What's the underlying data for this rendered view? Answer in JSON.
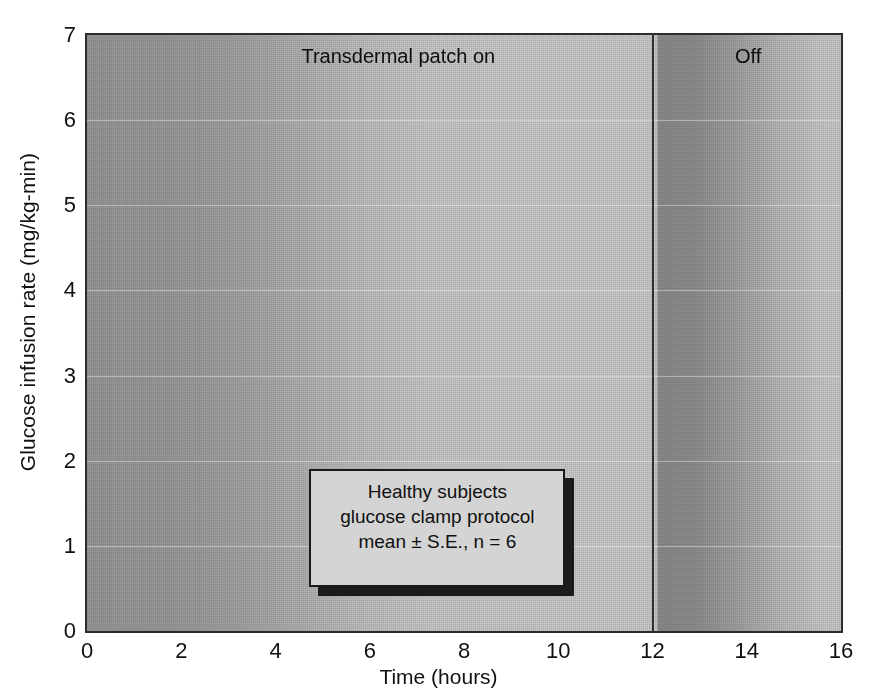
{
  "chart_data": {
    "type": "line",
    "title": "",
    "xlabel": "Time (hours)",
    "ylabel": "Glucose infusion rate (mg/kg-min)",
    "xlim": [
      0,
      16
    ],
    "ylim": [
      0,
      7
    ],
    "xticks": [
      0,
      2,
      4,
      6,
      8,
      10,
      12,
      14,
      16
    ],
    "yticks": [
      0,
      1,
      2,
      3,
      4,
      5,
      6,
      7
    ],
    "grid": true,
    "legend_position": "inside-bottom-center",
    "error_bars": "mean ± S.E.",
    "n": 6,
    "annotations": [
      {
        "text": "Transdermal patch on",
        "x_range": [
          0,
          12
        ]
      },
      {
        "text": "Off",
        "x_range": [
          12,
          16
        ]
      }
    ],
    "series": [
      {
        "name": "Glucose infusion rate",
        "x": [
          0,
          0.25,
          0.5,
          0.75,
          1,
          1.25,
          1.5,
          1.75,
          2,
          2.25,
          2.5,
          2.75,
          3,
          3.25,
          3.5,
          3.75,
          4,
          4.25,
          4.5,
          4.75,
          5,
          5.25,
          5.5,
          5.75,
          6,
          6.25,
          6.5,
          6.75,
          7,
          7.25,
          7.5,
          7.75,
          8,
          8.25,
          8.5,
          8.75,
          9,
          9.25,
          9.5,
          9.75,
          10,
          10.25,
          10.5,
          10.75,
          11,
          11.25,
          11.5,
          11.75,
          12,
          12.25,
          12.5,
          12.75,
          13,
          13.25,
          13.5,
          13.75,
          14,
          14.25,
          14.5,
          14.75,
          15,
          15.25,
          15.5,
          15.75,
          16
        ],
        "y": [
          0.05,
          0.3,
          0.5,
          0.62,
          0.72,
          0.85,
          1.05,
          1.35,
          1.6,
          1.9,
          2.1,
          2.45,
          2.8,
          2.9,
          2.85,
          3.25,
          3.7,
          4.1,
          4.45,
          4.6,
          4.55,
          4.62,
          4.7,
          4.95,
          5.05,
          4.78,
          4.6,
          4.55,
          4.62,
          4.7,
          5.0,
          4.9,
          4.7,
          4.58,
          4.62,
          4.62,
          4.55,
          4.6,
          4.7,
          4.6,
          4.5,
          4.78,
          4.98,
          4.85,
          4.55,
          4.35,
          4.28,
          4.3,
          4.3,
          4.32,
          4.32,
          4.3,
          3.8,
          3.55,
          3.3,
          2.95,
          2.7,
          2.45,
          2.22,
          1.95,
          1.72,
          1.55,
          1.42,
          1.38,
          1.6
        ],
        "yerr": [
          0.04,
          0.18,
          0.22,
          0.25,
          0.25,
          0.28,
          0.32,
          0.38,
          0.45,
          0.5,
          0.58,
          0.62,
          0.68,
          0.72,
          0.75,
          0.8,
          0.88,
          0.92,
          0.95,
          1.05,
          1.1,
          1.15,
          1.22,
          1.3,
          1.22,
          1.08,
          1.15,
          1.18,
          1.12,
          1.05,
          1.0,
          1.02,
          1.05,
          1.02,
          0.98,
          0.95,
          0.92,
          0.9,
          0.88,
          0.85,
          0.88,
          0.82,
          0.8,
          0.78,
          0.72,
          0.65,
          0.62,
          0.58,
          0.5,
          0.45,
          0.4,
          0.42,
          0.48,
          0.52,
          0.5,
          0.48,
          0.45,
          0.42,
          0.38,
          0.35,
          0.3,
          0.25,
          0.2,
          0.18,
          0.12
        ],
        "final_drop_to_zero_at_x": 16
      }
    ]
  },
  "axes": {
    "y_title": "Glucose infusion rate (mg/kg-min)",
    "x_title": "Time (hours)",
    "y_tick_labels": [
      "7",
      "6",
      "5",
      "4",
      "3",
      "2",
      "1",
      "0"
    ],
    "x_tick_labels": [
      "0",
      "2",
      "4",
      "6",
      "8",
      "10",
      "12",
      "14",
      "16"
    ]
  },
  "annotations": {
    "patch_on": "Transdermal patch on",
    "patch_off": "Off"
  },
  "legend_box": {
    "line1": "Healthy subjects",
    "line2": "glucose clamp protocol",
    "line3": "mean ± S.E., n = 6"
  },
  "colors": {
    "data": "#1b1b1b",
    "frame": "#2c2c2c",
    "bg_dark": "#9a9a9a",
    "bg_light": "#cdcdcd",
    "bg_off_band": "#8e8e8e",
    "legend_bg": "#d4d4d4",
    "text": "#111111"
  }
}
